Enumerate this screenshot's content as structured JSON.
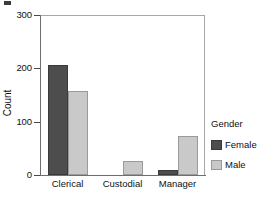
{
  "chart_data": {
    "type": "bar",
    "title": "",
    "xlabel": "",
    "ylabel": "Count",
    "categories": [
      "Clerical",
      "Custodial",
      "Manager"
    ],
    "series": [
      {
        "name": "Female",
        "color": "#4d4d4d",
        "values": [
          206,
          0,
          10
        ]
      },
      {
        "name": "Male",
        "color": "#c9c9c9",
        "values": [
          157,
          27,
          74
        ]
      }
    ],
    "ylim": [
      0,
      300
    ],
    "yticks": [
      0,
      100,
      200,
      300
    ],
    "ytick_labels": [
      "0",
      "100",
      "200",
      "300"
    ],
    "grid": false,
    "legend": {
      "title": "Gender",
      "position": "right",
      "entries": [
        {
          "label": "Female",
          "color": "#4d4d4d"
        },
        {
          "label": "Male",
          "color": "#c9c9c9"
        }
      ]
    }
  },
  "axes": {
    "y_label": "Count",
    "y_ticks": [
      {
        "label": "300",
        "value": 300
      },
      {
        "label": "200",
        "value": 200
      },
      {
        "label": "100",
        "value": 100
      },
      {
        "label": "0",
        "value": 0
      }
    ],
    "x_ticks": [
      {
        "label": "Clerical"
      },
      {
        "label": "Custodial"
      },
      {
        "label": "Manager"
      }
    ]
  },
  "legend": {
    "title": "Gender",
    "items": [
      {
        "label": "Female"
      },
      {
        "label": "Male"
      }
    ]
  },
  "colors": {
    "female": "#4d4d4d",
    "male": "#c9c9c9",
    "axis": "#6e6e6e",
    "frame": "#a8a8a8",
    "text": "#111111",
    "background": "#ffffff"
  }
}
